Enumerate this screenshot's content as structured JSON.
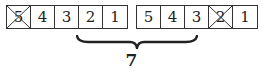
{
  "groups": [
    {
      "cells": [
        {
          "value": "5",
          "crossed": true
        },
        {
          "value": "4",
          "crossed": false
        },
        {
          "value": "3",
          "crossed": false
        },
        {
          "value": "2",
          "crossed": false
        },
        {
          "value": "1",
          "crossed": false
        }
      ]
    },
    {
      "cells": [
        {
          "value": "5",
          "crossed": false
        },
        {
          "value": "4",
          "crossed": false
        },
        {
          "value": "3",
          "crossed": false
        },
        {
          "value": "2",
          "crossed": true
        },
        {
          "value": "1",
          "crossed": false
        }
      ]
    }
  ],
  "brace_label": "7",
  "colors": {
    "stroke": "#333333",
    "text": "#222222",
    "background": "#ffffff"
  }
}
